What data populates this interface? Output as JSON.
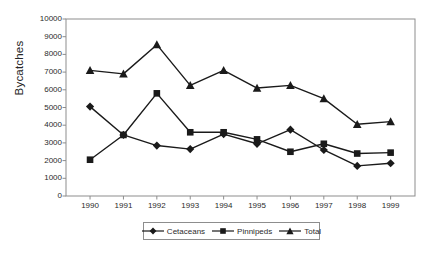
{
  "chart_data": {
    "type": "line",
    "title": "",
    "xlabel": "",
    "ylabel": "Bycatches",
    "categories": [
      "1990",
      "1991",
      "1992",
      "1993",
      "1994",
      "1995",
      "1996",
      "1997",
      "1998",
      "1999"
    ],
    "ylim": [
      0,
      10000
    ],
    "ytick_labels": [
      "10000",
      "9000",
      "8000",
      "7000",
      "6000",
      "5000",
      "4000",
      "3000",
      "2000",
      "1000",
      "0"
    ],
    "ytick_values": [
      10000,
      9000,
      8000,
      7000,
      6000,
      5000,
      4000,
      3000,
      2000,
      1000,
      0
    ],
    "grid": false,
    "legend_position": "bottom",
    "series": [
      {
        "name": "Cetaceans",
        "marker": "diamond",
        "color": "#1a1a1a",
        "values": [
          5050,
          3450,
          2850,
          2650,
          3500,
          2950,
          3750,
          2600,
          1700,
          1850
        ]
      },
      {
        "name": "Pinnipeds",
        "marker": "square",
        "color": "#1a1a1a",
        "values": [
          2050,
          3450,
          5800,
          3600,
          3600,
          3200,
          2500,
          2950,
          2400,
          2450
        ]
      },
      {
        "name": "Total",
        "marker": "triangle",
        "color": "#1a1a1a",
        "values": [
          7100,
          6900,
          8550,
          6250,
          7100,
          6100,
          6250,
          5500,
          4050,
          4200
        ]
      }
    ]
  },
  "legend": {
    "items": [
      {
        "label": "Cetaceans",
        "marker": "diamond"
      },
      {
        "label": "Pinnipeds",
        "marker": "square"
      },
      {
        "label": "Total",
        "marker": "triangle"
      }
    ]
  },
  "axes": {
    "y_title": "Bycatches"
  },
  "colors": {
    "series": "#1a1a1a",
    "axis": "#8d8d8d",
    "background": "#ffffff"
  }
}
